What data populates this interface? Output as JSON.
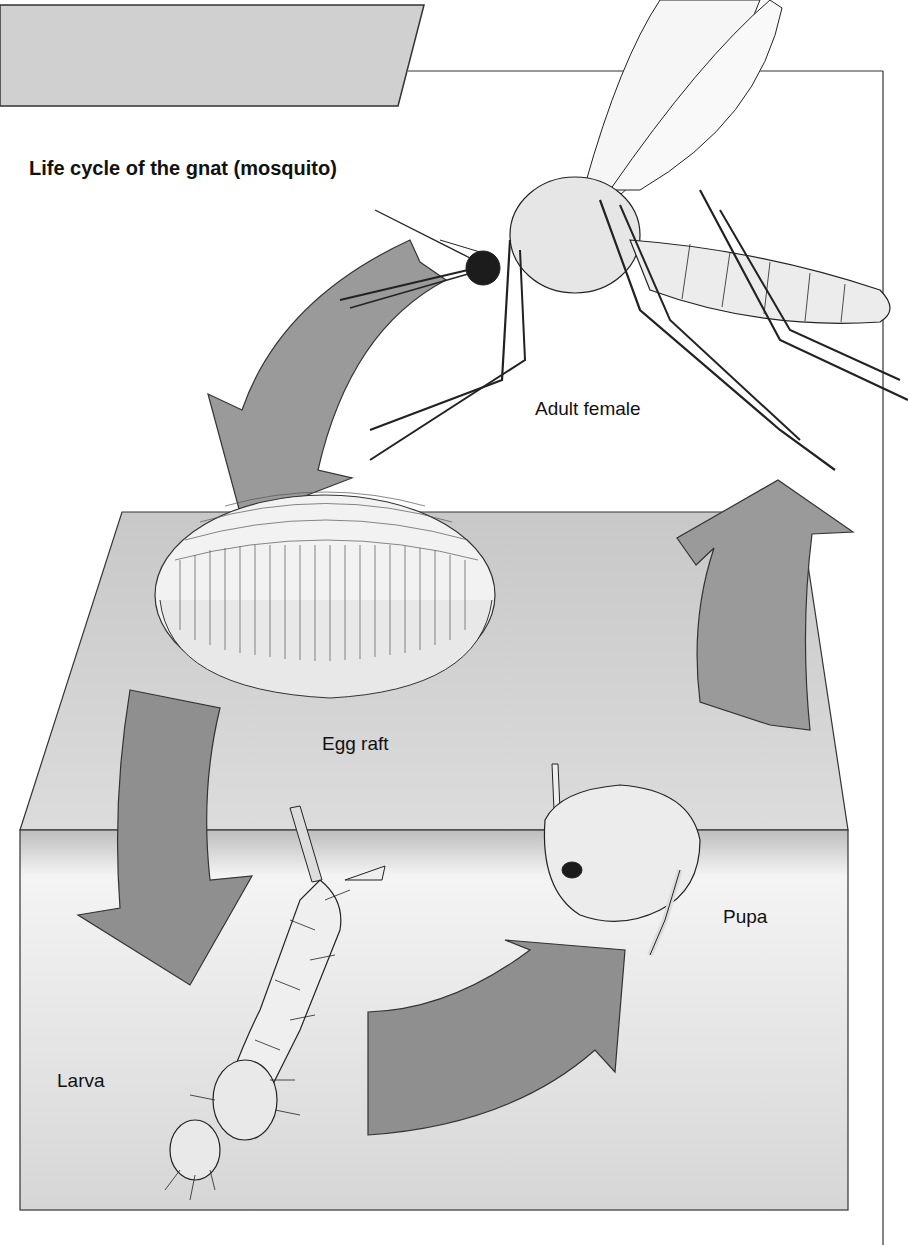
{
  "diagram": {
    "title": "Life cycle of the gnat (mosquito)",
    "stages": [
      {
        "id": "adult",
        "label": "Adult female"
      },
      {
        "id": "egg",
        "label": "Egg raft"
      },
      {
        "id": "larva",
        "label": "Larva"
      },
      {
        "id": "pupa",
        "label": "Pupa"
      }
    ],
    "cycle_order": [
      "Adult female",
      "Egg raft",
      "Larva",
      "Pupa",
      "Adult female"
    ],
    "colors": {
      "arrow_fill": "#9a9a9a",
      "header_band": "#cfcfcf",
      "water_surface": "#d3d3d3",
      "water_body": "#e2e2e2",
      "outline": "#222222",
      "background": "#ffffff"
    }
  }
}
